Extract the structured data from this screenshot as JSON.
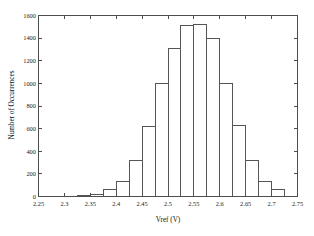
{
  "chart_data": {
    "type": "bar",
    "title": "",
    "subtitle": "",
    "xlabel": "Vref (V)",
    "ylabel": "Number of Occurrences",
    "xlim": [
      2.25,
      2.75
    ],
    "ylim": [
      0,
      1600
    ],
    "grid": false,
    "legend": null,
    "legend_position": "none",
    "bin_width": 0.025,
    "xticks": [
      2.25,
      2.3,
      2.35,
      2.4,
      2.45,
      2.5,
      2.55,
      2.6,
      2.65,
      2.7,
      2.75
    ],
    "xtick_labels": [
      "2.25",
      "2.3",
      "2.35",
      "2.4",
      "2.45",
      "2.5",
      "2.55",
      "2.6",
      "2.65",
      "2.7",
      "2.75"
    ],
    "yticks": [
      0,
      200,
      400,
      600,
      800,
      1000,
      1200,
      1400,
      1600
    ],
    "ytick_labels": [
      "0",
      "200",
      "400",
      "600",
      "800",
      "1000",
      "1200",
      "1400",
      "1600"
    ],
    "bin_edges": [
      2.325,
      2.35,
      2.375,
      2.4,
      2.425,
      2.45,
      2.475,
      2.5,
      2.525,
      2.55,
      2.575,
      2.6,
      2.625,
      2.65,
      2.675,
      2.7,
      2.725
    ],
    "categories": [
      "2.325-2.35",
      "2.35-2.375",
      "2.375-2.4",
      "2.4-2.425",
      "2.425-2.45",
      "2.45-2.475",
      "2.475-2.5",
      "2.5-2.525",
      "2.525-2.55",
      "2.55-2.575",
      "2.575-2.6",
      "2.6-2.625",
      "2.625-2.65",
      "2.65-2.675",
      "2.675-2.7",
      "2.7-2.725"
    ],
    "values": [
      5,
      20,
      65,
      135,
      315,
      615,
      995,
      1310,
      1510,
      1520,
      1400,
      995,
      625,
      315,
      135,
      65
    ]
  },
  "axes": {
    "x_title": "Vref (V)",
    "y_title": "Number of Occurrences"
  },
  "colors": {
    "bar_stroke": "#555555",
    "axis": "#4d4d4d",
    "text": "#1a1a1a",
    "background": "#ffffff"
  }
}
